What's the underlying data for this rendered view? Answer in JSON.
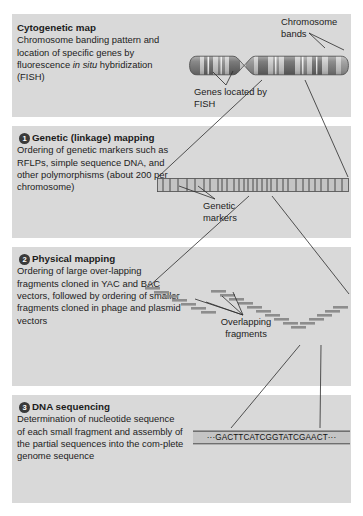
{
  "figure": {
    "background": "#ffffff",
    "panel_bg": "#d9d9d9"
  },
  "panels": [
    {
      "id": "cytogenetic",
      "number": "",
      "title": "Cytogenetic map",
      "body_pre": "Chromosome banding pattern and location of specific genes by fluorescence ",
      "body_italic": "in situ",
      "body_post": " hybridization (FISH)"
    },
    {
      "id": "genetic",
      "number": "1",
      "title": "Genetic (linkage) mapping",
      "body": "Ordering of genetic markers such as RFLPs, simple sequence DNA, and other polymorphisms (about 200 per chromosome)"
    },
    {
      "id": "physical",
      "number": "2",
      "title": "Physical mapping",
      "body": "Ordering of large over-lapping fragments cloned in YAC and BAC vectors, followed by ordering of smaller fragments cloned in phage and plasmid vectors"
    },
    {
      "id": "sequencing",
      "number": "3",
      "title": "DNA sequencing",
      "body": "Determination of nucleotide sequence of each small fragment and assembly of the partial sequences into the com-plete genome sequence"
    }
  ],
  "callouts": {
    "chromosome_bands": "Chromosome bands",
    "genes_located_by_fish": "Genes located by FISH",
    "genetic_markers": "Genetic markers",
    "overlapping_fragments": "Overlapping fragments"
  },
  "sequence": {
    "text": "···GACTTCATCGGTATCGAACT···",
    "bases": "GACTTCATCGGTATCGAACT",
    "length": 20
  },
  "chromosome_data": {
    "band_count": 13,
    "centromere_position_pct": 30,
    "colors": {
      "dark_band": "#6f6f6f",
      "light_band": "#c9c9c9",
      "outline": "#4a4a4a"
    }
  },
  "marker_data": {
    "tick_count": 42,
    "bar_fill": "#c2c2c2",
    "bar_outline": "#4a4a4a"
  },
  "fragment_data": {
    "fragment_count": 26,
    "color": "#8d8d8d"
  }
}
